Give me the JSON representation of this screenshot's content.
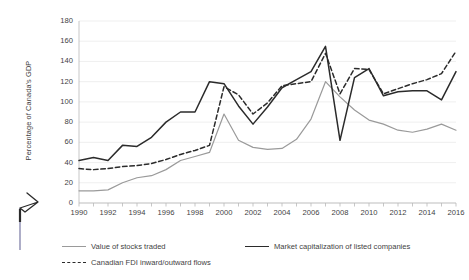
{
  "chart_data": {
    "type": "line",
    "title": "",
    "xlabel": "",
    "ylabel": "Percentage of Canada's GDP",
    "ylim": [
      0,
      180
    ],
    "ytick_values": [
      0,
      20,
      40,
      60,
      80,
      100,
      120,
      140,
      160,
      180
    ],
    "xlim": [
      1990,
      2016
    ],
    "xtick_labels": [
      "1990",
      "1992",
      "1994",
      "1996",
      "1998",
      "2000",
      "2002",
      "2004",
      "2006",
      "2008",
      "2010",
      "2012",
      "2014",
      "2016"
    ],
    "grid": true,
    "legend_position": "bottom",
    "x": [
      1990,
      1991,
      1992,
      1993,
      1994,
      1995,
      1996,
      1997,
      1998,
      1999,
      2000,
      2001,
      2002,
      2003,
      2004,
      2005,
      2006,
      2007,
      2008,
      2009,
      2010,
      2011,
      2012,
      2013,
      2014,
      2015,
      2016
    ],
    "series": [
      {
        "name": "Value of stocks traded",
        "color": "#9a9a9a",
        "style": "solid",
        "values": [
          12,
          12,
          13,
          20,
          25,
          27,
          33,
          42,
          46,
          50,
          88,
          62,
          55,
          53,
          54,
          63,
          83,
          120,
          105,
          92,
          82,
          78,
          72,
          70,
          73,
          78,
          72
        ]
      },
      {
        "name": "Market capitalization of listed companies",
        "color": "#2b2b2b",
        "style": "solid",
        "values": [
          42,
          45,
          42,
          57,
          56,
          65,
          80,
          90,
          90,
          120,
          118,
          96,
          78,
          95,
          114,
          122,
          130,
          155,
          62,
          124,
          133,
          106,
          110,
          111,
          111,
          102,
          130
        ]
      },
      {
        "name": "Canadian FDI inward/outward flows",
        "color": "#2b2b2b",
        "style": "dashed",
        "values": [
          34,
          33,
          34,
          36,
          37,
          39,
          43,
          48,
          52,
          57,
          115,
          107,
          88,
          99,
          116,
          118,
          120,
          148,
          108,
          133,
          132,
          108,
          113,
          118,
          122,
          128,
          150
        ]
      }
    ]
  },
  "legend": {
    "items": [
      {
        "label": "Value of stocks traded",
        "style": "solid-gray"
      },
      {
        "label": "Market capitalization of listed companies",
        "style": "solid-black"
      },
      {
        "label": "Canadian FDI inward/outward flows",
        "style": "dashed"
      }
    ]
  }
}
